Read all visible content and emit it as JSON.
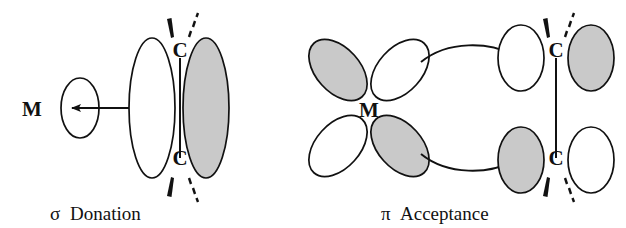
{
  "figure": {
    "background_color": "#ffffff",
    "stroke_color": "#111111",
    "shaded_lobe_color": "#c9c9c9",
    "empty_lobe_color": "#ffffff"
  },
  "panels": [
    {
      "id": "sigma-donation",
      "caption_symbol": "σ",
      "caption_text": "Donation",
      "metal_label": "M",
      "carbon_top_label": "C",
      "carbon_bottom_label": "C",
      "arrow_direction": "right-to-left",
      "arrow_meaning": "electron donation from alkene pi orbital into empty metal orbital",
      "metal_orbital": {
        "type": "empty-s-orbital",
        "fill": "empty",
        "lobes": 1
      },
      "ligand_orbital": {
        "type": "alkene-pi-bonding",
        "lobes": [
          {
            "position": "left",
            "fill": "empty"
          },
          {
            "position": "right",
            "fill": "shaded"
          }
        ]
      },
      "substituent_bonds": [
        "wedge",
        "dash",
        "wedge",
        "dash"
      ]
    },
    {
      "id": "pi-acceptance",
      "caption_symbol": "π",
      "caption_text": "Acceptance",
      "metal_label": "M",
      "carbon_top_label": "C",
      "carbon_bottom_label": "C",
      "arrow_direction": "left-to-right",
      "arrow_meaning": "back-donation from filled metal d orbital into alkene pi-star orbital",
      "metal_orbital": {
        "type": "d-orbital",
        "lobes": [
          {
            "position": "upper-left",
            "fill": "shaded"
          },
          {
            "position": "upper-right",
            "fill": "empty"
          },
          {
            "position": "lower-left",
            "fill": "empty"
          },
          {
            "position": "lower-right",
            "fill": "shaded"
          }
        ]
      },
      "ligand_orbital": {
        "type": "alkene-pi-antibonding",
        "lobes": [
          {
            "position": "upper-left",
            "fill": "empty"
          },
          {
            "position": "upper-right",
            "fill": "shaded"
          },
          {
            "position": "lower-left",
            "fill": "shaded"
          },
          {
            "position": "lower-right",
            "fill": "empty"
          }
        ]
      },
      "substituent_bonds": [
        "wedge",
        "dash",
        "wedge",
        "dash"
      ],
      "curved_arrows": 2
    }
  ],
  "captions": {
    "left_full": "σ Donation",
    "right_full": "π Acceptance"
  }
}
